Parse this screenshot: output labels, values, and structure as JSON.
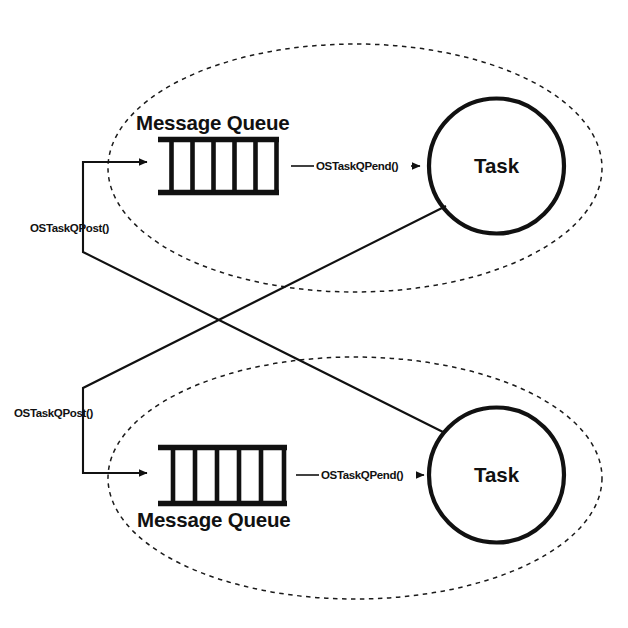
{
  "diagram": {
    "colors": {
      "stroke": "#111111",
      "background": "#ffffff",
      "dashed_boundary": "#1a1a1a"
    },
    "groups": [
      {
        "id": "upper-group",
        "queue_label": "Message Queue",
        "task_label": "Task",
        "post_label": "OSTaskQPost()",
        "pend_label": "OSTaskQPend()",
        "queue_cells": 5,
        "queue_dividers": 6
      },
      {
        "id": "lower-group",
        "queue_label": "Message Queue",
        "task_label": "Task",
        "post_label": "OSTaskQPost()",
        "pend_label": "OSTaskQPend()",
        "queue_cells": 5,
        "queue_dividers": 6
      }
    ]
  },
  "upper": {
    "queue_label": "Message Queue",
    "task_label": "Task",
    "post_label": "OSTaskQPost()",
    "pend_label": "OSTaskQPend()"
  },
  "lower": {
    "queue_label": "Message Queue",
    "task_label": "Task",
    "post_label": "OSTaskQPost()",
    "pend_label": "OSTaskQPend()"
  }
}
